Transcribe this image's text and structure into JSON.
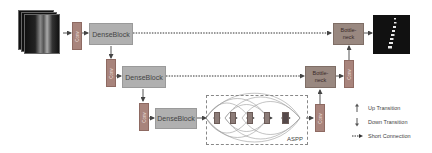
{
  "diagram": {
    "blocks": {
      "dense1": "DenseBlock",
      "dense2": "DenseBlock",
      "dense3": "DenseBlock",
      "conv_label": "Conv",
      "bottleneck1": "Bottle-\nneck",
      "bottleneck2": "Bottle-\nneck",
      "aspp_label": "ASPP"
    },
    "input_image": "spine-mri-stack",
    "output_image": "vertebra-segmentation-mask",
    "legend": {
      "up": "Up Transition",
      "down": "Down Transition",
      "short": "Short Connection"
    },
    "colors": {
      "dense": "#b0b0b0",
      "conv": "#a8847c",
      "bottleneck": "#998880",
      "aspp_unit": "#8c7c78"
    }
  }
}
